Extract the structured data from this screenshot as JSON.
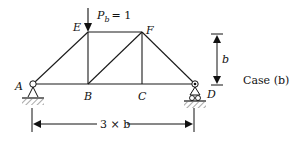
{
  "diagram": {
    "case_label": "Case (b)",
    "load": {
      "label_main": "P",
      "label_sub": "b",
      "label_value": "= 1",
      "node": "E"
    },
    "nodes": {
      "A": {
        "label": "A",
        "x": 33,
        "y": 84
      },
      "B": {
        "label": "B",
        "x": 88,
        "y": 84
      },
      "C": {
        "label": "C",
        "x": 142,
        "y": 84
      },
      "D": {
        "label": "D",
        "x": 195,
        "y": 84
      },
      "E": {
        "label": "E",
        "x": 88,
        "y": 32
      },
      "F": {
        "label": "F",
        "x": 142,
        "y": 32
      }
    },
    "members": [
      [
        "A",
        "B"
      ],
      [
        "B",
        "C"
      ],
      [
        "C",
        "D"
      ],
      [
        "E",
        "F"
      ],
      [
        "A",
        "E"
      ],
      [
        "E",
        "B"
      ],
      [
        "B",
        "F"
      ],
      [
        "F",
        "C"
      ],
      [
        "F",
        "D"
      ]
    ],
    "supports": {
      "A": "pin",
      "D": "roller"
    },
    "dimensions": {
      "height": {
        "label": "b"
      },
      "span": {
        "label": "3 × b"
      }
    }
  }
}
